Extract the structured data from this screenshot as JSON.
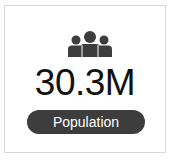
{
  "card": {
    "icon": "people-group-icon",
    "value": "30.3M",
    "label": "Population"
  },
  "colors": {
    "icon": "#3d3d3d",
    "value_text": "#111111",
    "pill_background": "#3d3d3d",
    "pill_text": "#ffffff",
    "border": "#d8d8d8"
  }
}
